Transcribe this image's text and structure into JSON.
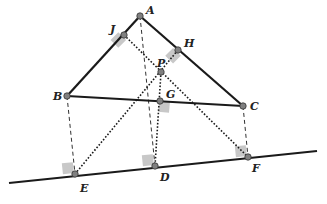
{
  "diagram": {
    "colors": {
      "line": "#1a1a1a",
      "point_fill": "#808080",
      "point_stroke": "#333333",
      "right_angle": "#c8c8c8"
    },
    "points": [
      {
        "id": "A",
        "label": "A",
        "x": 140,
        "y": 16,
        "lx": 146,
        "ly": 14
      },
      {
        "id": "J",
        "label": "J",
        "x": 124,
        "y": 35,
        "lx": 110,
        "ly": 33
      },
      {
        "id": "H",
        "label": "H",
        "x": 178,
        "y": 50,
        "lx": 184,
        "ly": 47
      },
      {
        "id": "P",
        "label": "P",
        "x": 161,
        "y": 72,
        "lx": 157,
        "ly": 67
      },
      {
        "id": "B",
        "label": "B",
        "x": 67,
        "y": 96,
        "lx": 53,
        "ly": 100
      },
      {
        "id": "G",
        "label": "G",
        "x": 160,
        "y": 101,
        "lx": 166,
        "ly": 98
      },
      {
        "id": "C",
        "label": "C",
        "x": 243,
        "y": 106,
        "lx": 250,
        "ly": 110
      },
      {
        "id": "E",
        "label": "E",
        "x": 75,
        "y": 174,
        "lx": 80,
        "ly": 192
      },
      {
        "id": "D",
        "label": "D",
        "x": 155,
        "y": 166,
        "lx": 160,
        "ly": 181
      },
      {
        "id": "F",
        "label": "F",
        "x": 248,
        "y": 157,
        "lx": 252,
        "ly": 172
      }
    ],
    "solid_segments": [
      {
        "from": "A",
        "to": "B"
      },
      {
        "from": "A",
        "to": "C"
      },
      {
        "from": "B",
        "to": "C"
      }
    ],
    "base_line": {
      "x1": 9,
      "y1": 183,
      "x2": 317,
      "y2": 151
    },
    "dashed_segments": [
      {
        "from": "A",
        "to": "D"
      },
      {
        "from": "B",
        "to": "E"
      },
      {
        "from": "C",
        "to": "F"
      }
    ],
    "dotted_segments": [
      {
        "from": "J",
        "to": "F"
      },
      {
        "from": "H",
        "to": "E"
      },
      {
        "from": "P",
        "to": "D"
      }
    ],
    "right_angle_marks": [
      {
        "at": "J",
        "x": 124,
        "y": 35,
        "rot": 45
      },
      {
        "at": "H",
        "x": 178,
        "y": 50,
        "rot": 45
      },
      {
        "at": "G",
        "x": 160,
        "y": 101,
        "rot": 5
      },
      {
        "at": "E",
        "x": 75,
        "y": 174,
        "rot": -6
      },
      {
        "at": "D",
        "x": 155,
        "y": 166,
        "rot": -6
      },
      {
        "at": "F",
        "x": 248,
        "y": 157,
        "rot": -6
      }
    ]
  }
}
